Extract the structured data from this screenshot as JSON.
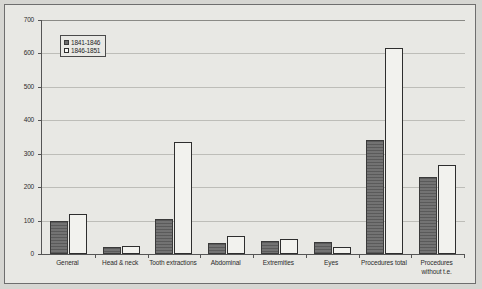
{
  "chart_data": {
    "type": "bar",
    "title": "",
    "xlabel": "",
    "ylabel": "",
    "ylim": [
      0,
      700
    ],
    "yticks": [
      0,
      100,
      200,
      300,
      400,
      500,
      600,
      700
    ],
    "grid": true,
    "legend_position": "top-left",
    "categories": [
      "General",
      "Head & neck",
      "Tooth extractions",
      "Abdominal",
      "Extremities",
      "Eyes",
      "Procedures total",
      "Procedures without t.e."
    ],
    "series": [
      {
        "name": "1841-1846",
        "color": "#6b6b6b",
        "values": [
          100,
          20,
          105,
          33,
          40,
          35,
          340,
          230
        ]
      },
      {
        "name": "1846-1851",
        "color": "#f2f2ee",
        "values": [
          120,
          25,
          335,
          55,
          45,
          20,
          615,
          265
        ]
      }
    ]
  },
  "legend": {
    "items": [
      {
        "label": "1841-1846"
      },
      {
        "label": "1846-1851"
      }
    ]
  }
}
